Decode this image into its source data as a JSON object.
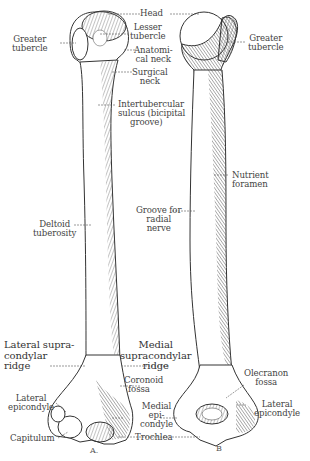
{
  "figure": {
    "view_labels": {
      "a": "A.",
      "b": "B"
    }
  },
  "labels_a": {
    "head": "Head",
    "greater_tubercle": [
      "Greater",
      "tubercle"
    ],
    "lesser_tubercle": [
      "Lesser",
      "tubercle"
    ],
    "anatomical_neck": [
      "Anatomi-",
      "cal neck"
    ],
    "surgical_neck": [
      "Surgical",
      "neck"
    ],
    "intertubercular_sulcus": [
      "Intertubercular",
      "sulcus (bicipital",
      "groove)"
    ],
    "deltoid_tuberosity": [
      "Deltoid",
      "tuberosity"
    ],
    "lateral_supracondylar_ridge": [
      "Lateral supra-",
      "condylar",
      "ridge"
    ],
    "medial_supracondylar_ridge": [
      "Medial",
      "supracondylar",
      "ridge"
    ],
    "coronoid_fossa": [
      "Coronoid",
      "fossa"
    ],
    "lateral_epicondyle": [
      "Lateral",
      "epicondyle"
    ],
    "medial_epicondyle": [
      "Medial",
      "epi-",
      "condyle"
    ],
    "capitulum": "Capitulum",
    "trochlea": "Trochlea"
  },
  "labels_b": {
    "greater_tubercle": [
      "Greater",
      "tubercle"
    ],
    "nutrient_foramen": [
      "Nutrient",
      "foramen"
    ],
    "groove_radial_nerve": [
      "Groove for",
      "radial",
      "nerve"
    ],
    "olecranon_fossa": [
      "Olecranon",
      "fossa"
    ],
    "lateral_epicondyle": [
      "Lateral",
      "epicondyle"
    ]
  },
  "colors": {
    "ink": "#333333",
    "label": "#444444",
    "background": "#ffffff"
  }
}
